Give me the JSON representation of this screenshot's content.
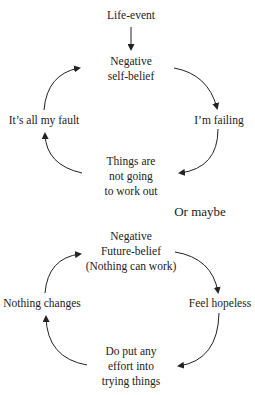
{
  "cycle1": {
    "trigger": "Life-event",
    "top": [
      "Negative",
      "self-belief"
    ],
    "right": "I’m failing",
    "bottom": [
      "Things are",
      "not going",
      "to work out"
    ],
    "left": "It’s all my fault"
  },
  "separator": "Or maybe",
  "cycle2": {
    "top": [
      "Negative",
      "Future-belief",
      "(Nothing can work)"
    ],
    "right": "Feel hopeless",
    "bottom": [
      "Do put any",
      "effort into",
      "trying things"
    ],
    "left": "Nothing changes"
  },
  "colors": {
    "text": "#222222",
    "arrow": "#222222",
    "background": "#ffffff"
  }
}
